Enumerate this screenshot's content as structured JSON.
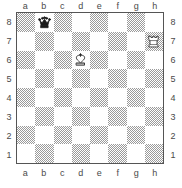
{
  "board": {
    "title": "Chess position diagram",
    "files": [
      "a",
      "b",
      "c",
      "d",
      "e",
      "f",
      "g",
      "h"
    ],
    "ranks": [
      "8",
      "7",
      "6",
      "5",
      "4",
      "3",
      "2",
      "1"
    ],
    "orientation": "white-bottom",
    "light_square_color": "#ffffff",
    "dark_square_color": "#9a9a9a",
    "border_color": "#555555",
    "label_color": "#4a4a4a",
    "dark_square_at": "a1",
    "labels": {
      "files_top": [
        "a",
        "b",
        "c",
        "d",
        "e",
        "f",
        "g",
        "h"
      ],
      "files_bottom": [
        "a",
        "b",
        "c",
        "d",
        "e",
        "f",
        "g",
        "h"
      ],
      "ranks_left": [
        "8",
        "7",
        "6",
        "5",
        "4",
        "3",
        "2",
        "1"
      ],
      "ranks_right": [
        "8",
        "7",
        "6",
        "5",
        "4",
        "3",
        "2",
        "1"
      ]
    },
    "pieces": [
      {
        "square": "b8",
        "file": "b",
        "rank": "8",
        "type": "queen",
        "color": "black",
        "symbol": "♛",
        "name": "black-queen"
      },
      {
        "square": "h7",
        "file": "h",
        "rank": "7",
        "type": "rook",
        "color": "white",
        "symbol": "♖",
        "name": "white-rook"
      },
      {
        "square": "d6",
        "file": "d",
        "rank": "6",
        "type": "king",
        "color": "white",
        "symbol": "♔",
        "name": "white-king"
      }
    ],
    "fen": "1q6/7R/3K4/8/8/8/8/8",
    "piece_count": 3
  }
}
